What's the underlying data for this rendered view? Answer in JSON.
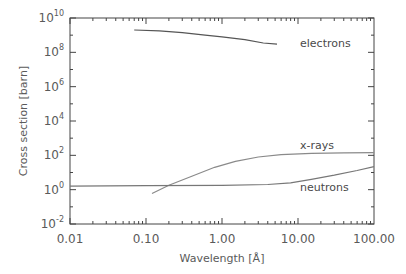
{
  "chart_data": {
    "type": "line",
    "title": "",
    "xlabel": "Wavelength [Å]",
    "ylabel": "Cross section [barn]",
    "xscale": "log",
    "yscale": "log",
    "xlim": [
      0.01,
      100
    ],
    "ylim": [
      0.01,
      10000000000
    ],
    "x_tick_labels": [
      "0.01",
      "0.10",
      "1.00",
      "10.00",
      "100.00"
    ],
    "x_tick_values": [
      0.01,
      0.1,
      1,
      10,
      100
    ],
    "y_tick_labels": [
      {
        "base": "10",
        "exp": "10"
      },
      {
        "base": "10",
        "exp": "8"
      },
      {
        "base": "10",
        "exp": "6"
      },
      {
        "base": "10",
        "exp": "4"
      },
      {
        "base": "10",
        "exp": "2"
      },
      {
        "base": "10",
        "exp": "0"
      },
      {
        "base": "10",
        "exp": "-2"
      }
    ],
    "y_tick_exponents": [
      10,
      8,
      6,
      4,
      2,
      0,
      -2
    ],
    "grid": false,
    "legend": "inline labels",
    "series": [
      {
        "name": "electrons",
        "color": "#555555",
        "points": [
          [
            0.07,
            2000000000
          ],
          [
            0.15,
            1800000000
          ],
          [
            0.3,
            1400000000
          ],
          [
            0.6,
            1000000000
          ],
          [
            1.0,
            800000000
          ],
          [
            2.0,
            550000000
          ],
          [
            3.5,
            350000000
          ],
          [
            5.3,
            300000000
          ]
        ]
      },
      {
        "name": "x-rays",
        "color": "#8a8a8a",
        "points": [
          [
            0.12,
            0.6
          ],
          [
            0.2,
            1.8
          ],
          [
            0.4,
            6
          ],
          [
            0.8,
            20
          ],
          [
            1.5,
            45
          ],
          [
            3.0,
            80
          ],
          [
            6.0,
            110
          ],
          [
            15.0,
            130
          ],
          [
            40.0,
            140
          ],
          [
            100.0,
            145
          ]
        ]
      },
      {
        "name": "neutrons",
        "color": "#777777",
        "points": [
          [
            0.01,
            1.6
          ],
          [
            0.1,
            1.7
          ],
          [
            1.0,
            1.8
          ],
          [
            4.0,
            2.0
          ],
          [
            8.0,
            2.5
          ],
          [
            15.0,
            4
          ],
          [
            30.0,
            7
          ],
          [
            60.0,
            13
          ],
          [
            100.0,
            22
          ]
        ]
      }
    ],
    "annotations": [
      "electrons",
      "x-rays",
      "neutrons"
    ]
  },
  "labels": {
    "xlabel": "Wavelength [Å]",
    "ylabel": "Cross section [barn]",
    "electrons": "electrons",
    "xrays": "x-rays",
    "neutrons": "neutrons"
  }
}
